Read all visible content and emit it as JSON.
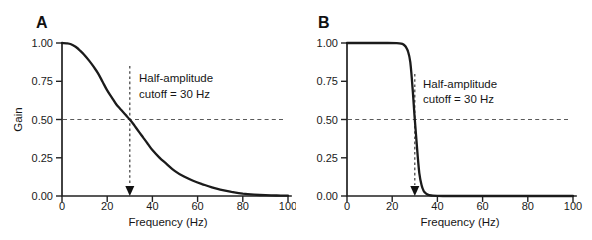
{
  "figure": {
    "background": "#ffffff",
    "ink": "#1a1a1a",
    "dashed_line_color": "#555555"
  },
  "chart_data": [
    {
      "type": "line",
      "panel_label": "A",
      "xlabel": "Frequency (Hz)",
      "ylabel": "Gain",
      "xlim": [
        0,
        100
      ],
      "ylim": [
        0,
        1
      ],
      "xticks": [
        0,
        20,
        40,
        60,
        80,
        100
      ],
      "xtick_labels": [
        "0",
        "20",
        "40",
        "60",
        "80",
        "100"
      ],
      "ytick_values": [
        0,
        0.25,
        0.5,
        0.75,
        1.0
      ],
      "ytick_labels": [
        "0.00",
        "0.25",
        "0.50",
        "0.75",
        "1.00"
      ],
      "grid": false,
      "legend": null,
      "annotation": {
        "line1": "Half-amplitude",
        "line2": "cutoff = 30 Hz"
      },
      "reference": {
        "cutoff_hz": 30,
        "half_amplitude_gain": 0.5
      },
      "series": [
        {
          "name": "gradual-rolloff-filter-response",
          "x": [
            0,
            2,
            4,
            6,
            8,
            10,
            12,
            14,
            16,
            18,
            20,
            22,
            24,
            26,
            28,
            30,
            32,
            34,
            36,
            38,
            40,
            43,
            46,
            50,
            54,
            58,
            62,
            66,
            70,
            75,
            80,
            85,
            90,
            95,
            100
          ],
          "y": [
            1.0,
            0.998,
            0.992,
            0.975,
            0.95,
            0.92,
            0.885,
            0.845,
            0.8,
            0.745,
            0.69,
            0.645,
            0.6,
            0.565,
            0.532,
            0.5,
            0.462,
            0.42,
            0.38,
            0.34,
            0.3,
            0.252,
            0.213,
            0.163,
            0.127,
            0.1,
            0.078,
            0.058,
            0.042,
            0.027,
            0.016,
            0.009,
            0.005,
            0.003,
            0.002
          ]
        }
      ]
    },
    {
      "type": "line",
      "panel_label": "B",
      "xlabel": "Frequency (Hz)",
      "ylabel": "",
      "xlim": [
        0,
        100
      ],
      "ylim": [
        0,
        1
      ],
      "xticks": [
        0,
        20,
        40,
        60,
        80,
        100
      ],
      "xtick_labels": [
        "0",
        "20",
        "40",
        "60",
        "80",
        "100"
      ],
      "ytick_values": [
        0,
        0.25,
        0.5,
        0.75,
        1.0
      ],
      "ytick_labels": [
        "0.00",
        "0.25",
        "0.50",
        "0.75",
        "1.00"
      ],
      "grid": false,
      "legend": null,
      "annotation": {
        "line1": "Half-amplitude",
        "line2": "cutoff = 30 Hz"
      },
      "reference": {
        "cutoff_hz": 30,
        "half_amplitude_gain": 0.5
      },
      "series": [
        {
          "name": "sharp-rolloff-filter-response",
          "x": [
            0,
            10,
            18,
            22,
            24,
            25,
            26,
            27,
            28,
            29,
            30,
            31,
            32,
            33,
            34,
            35,
            36,
            37,
            38,
            40,
            45,
            50,
            60,
            70,
            80,
            90,
            100
          ],
          "y": [
            1.0,
            1.0,
            1.0,
            0.999,
            0.996,
            0.99,
            0.975,
            0.945,
            0.875,
            0.71,
            0.5,
            0.31,
            0.15,
            0.07,
            0.032,
            0.016,
            0.008,
            0.004,
            0.002,
            0.001,
            0,
            0,
            0,
            0,
            0,
            0,
            0
          ]
        }
      ]
    }
  ]
}
